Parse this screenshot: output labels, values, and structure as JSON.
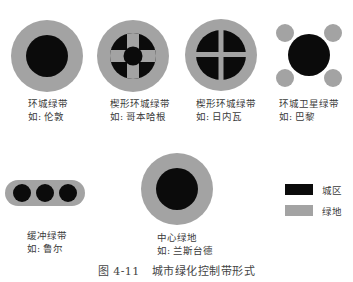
{
  "colors": {
    "urban": "#0b0b0b",
    "green": "#a3a3a3",
    "background": "#ffffff"
  },
  "forms": [
    {
      "name": "环城绿带",
      "example": "如: 伦敦"
    },
    {
      "name": "楔形环城绿带",
      "example": "如: 哥本哈根"
    },
    {
      "name": "楔形环城绿带",
      "example": "如: 日内瓦"
    },
    {
      "name": "环城卫星绿带",
      "example": "如: 巴黎"
    },
    {
      "name": "缓冲绿带",
      "example": "如: 鲁尔"
    },
    {
      "name": "中心绿地",
      "example": "如: 兰斯台德"
    }
  ],
  "legend": [
    {
      "label": "城区",
      "color": "#0b0b0b"
    },
    {
      "label": "绿地",
      "color": "#a3a3a3"
    }
  ],
  "caption": "图 4-11   城市绿化控制带形式"
}
